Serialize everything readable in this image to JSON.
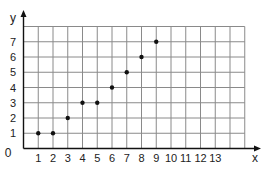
{
  "chart_data": {
    "type": "scatter",
    "title": "",
    "xlabel": "x",
    "ylabel": "y",
    "origin_label": "0",
    "xlim": [
      0,
      15
    ],
    "ylim": [
      0,
      8
    ],
    "grid": true,
    "legend": null,
    "x_ticks": [
      "1",
      "2",
      "3",
      "4",
      "5",
      "6",
      "7",
      "8",
      "9",
      "10",
      "11",
      "12",
      "13"
    ],
    "y_ticks": [
      "1",
      "2",
      "3",
      "4",
      "5",
      "6",
      "7"
    ],
    "points": [
      {
        "x": 1,
        "y": 1
      },
      {
        "x": 2,
        "y": 1
      },
      {
        "x": 3,
        "y": 2
      },
      {
        "x": 4,
        "y": 3
      },
      {
        "x": 5,
        "y": 3
      },
      {
        "x": 6,
        "y": 4
      },
      {
        "x": 7,
        "y": 5
      },
      {
        "x": 8,
        "y": 6
      },
      {
        "x": 9,
        "y": 7
      }
    ],
    "x": [
      1,
      2,
      3,
      4,
      5,
      6,
      7,
      8,
      9
    ],
    "values": [
      1,
      1,
      2,
      3,
      3,
      4,
      5,
      6,
      7
    ]
  },
  "colors": {
    "grid": "#8a8a8a",
    "axis": "#111111",
    "point": "#111111",
    "background": "#ffffff"
  }
}
